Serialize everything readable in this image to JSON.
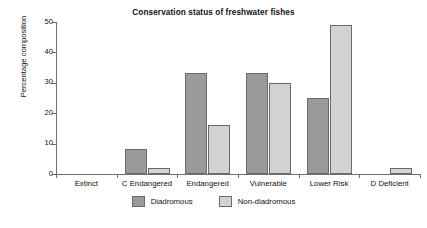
{
  "chart_data": {
    "type": "bar",
    "title": "Conservation status of freshwater fishes",
    "xlabel": "",
    "ylabel": "Percentage composition",
    "categories": [
      "Extinct",
      "C Endangered",
      "Endangered",
      "Vulnerable",
      "Lower Risk",
      "D Deficient"
    ],
    "series": [
      {
        "name": "Diadromous",
        "color": "#9a9a9a",
        "values": [
          0,
          8.3,
          33.3,
          33.3,
          25,
          0
        ]
      },
      {
        "name": "Non-diadromous",
        "color": "#d2d2d2",
        "values": [
          0,
          2,
          16,
          30,
          49,
          2
        ]
      }
    ],
    "ylim": [
      0,
      50
    ],
    "yticks": [
      0,
      10,
      20,
      30,
      40,
      50
    ],
    "ytick_labels": [
      "0",
      "10",
      "20",
      "30",
      "40",
      "50"
    ],
    "grid": false,
    "legend_position": "bottom"
  }
}
